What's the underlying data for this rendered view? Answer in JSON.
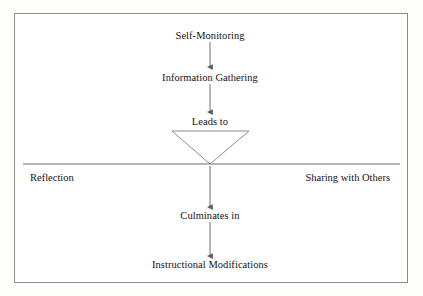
{
  "diagram": {
    "border_color": "#8a8a8a",
    "line_color": "#6f6f6f",
    "text_color": "#15130f",
    "background": "#ffffff",
    "nodes": [
      {
        "id": "self-monitoring",
        "label": "Self-Monitoring",
        "x": 210,
        "y": 36
      },
      {
        "id": "information-gathering",
        "label": "Information Gathering",
        "x": 210,
        "y": 78
      },
      {
        "id": "leads-to",
        "label": "Leads to",
        "x": 210,
        "y": 122
      },
      {
        "id": "culminates-in",
        "label": "Culminates in",
        "x": 210,
        "y": 216
      },
      {
        "id": "instructional-modifications",
        "label": "Instructional Modifications",
        "x": 210,
        "y": 265
      }
    ],
    "side_labels": [
      {
        "id": "reflection",
        "label": "Reflection",
        "x": 30,
        "y": 178,
        "align": "left"
      },
      {
        "id": "sharing-with-others",
        "label": "Sharing with Others",
        "x": 390,
        "y": 178,
        "align": "right"
      }
    ],
    "connectors": [
      {
        "id": "arrow-self-monitoring-to-information-gathering",
        "from_y": 42,
        "to_y": 67
      },
      {
        "id": "arrow-information-gathering-to-leads-to",
        "from_y": 84,
        "to_y": 112
      },
      {
        "id": "arrow-divider-to-culminates-in",
        "from_y": 166,
        "to_y": 207
      },
      {
        "id": "arrow-culminates-in-to-instructional-modifications",
        "from_y": 222,
        "to_y": 256
      }
    ],
    "funnel": {
      "id": "funnel-triangle",
      "left_x": 172,
      "right_x": 249,
      "top_y": 131,
      "apex_x": 210,
      "apex_y": 164
    },
    "divider": {
      "id": "horizontal-divider",
      "x1": 23,
      "x2": 400,
      "y": 164
    }
  }
}
